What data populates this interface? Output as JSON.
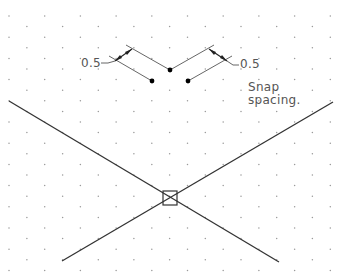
{
  "diagram": {
    "type": "isometric snap grid illustration",
    "background": "#ffffff",
    "grid": {
      "style": "isometric dots",
      "dot_color": "#9a9a9a",
      "col_spacing": 35.7,
      "half_row_spacing": 10.6,
      "origin_x": 9,
      "origin_y": 16
    },
    "labels": {
      "left_dimension": "0.5",
      "right_dimension": "0.5",
      "snap_line1": "Snap",
      "snap_line2": "spacing."
    },
    "snap_points": [
      {
        "x": 170,
        "y": 70
      },
      {
        "x": 152,
        "y": 81
      },
      {
        "x": 188,
        "y": 81
      }
    ],
    "crosshair_lines": [
      {
        "x1": 9,
        "y1": 101,
        "x2": 279,
        "y2": 262
      },
      {
        "x1": 333,
        "y1": 102,
        "x2": 62,
        "y2": 261
      }
    ],
    "cursor_box": {
      "cx": 170,
      "cy": 198,
      "size": 14
    },
    "colors": {
      "line": "#333333",
      "dimension": "#555555",
      "text": "#555555",
      "point": "#000000"
    }
  }
}
